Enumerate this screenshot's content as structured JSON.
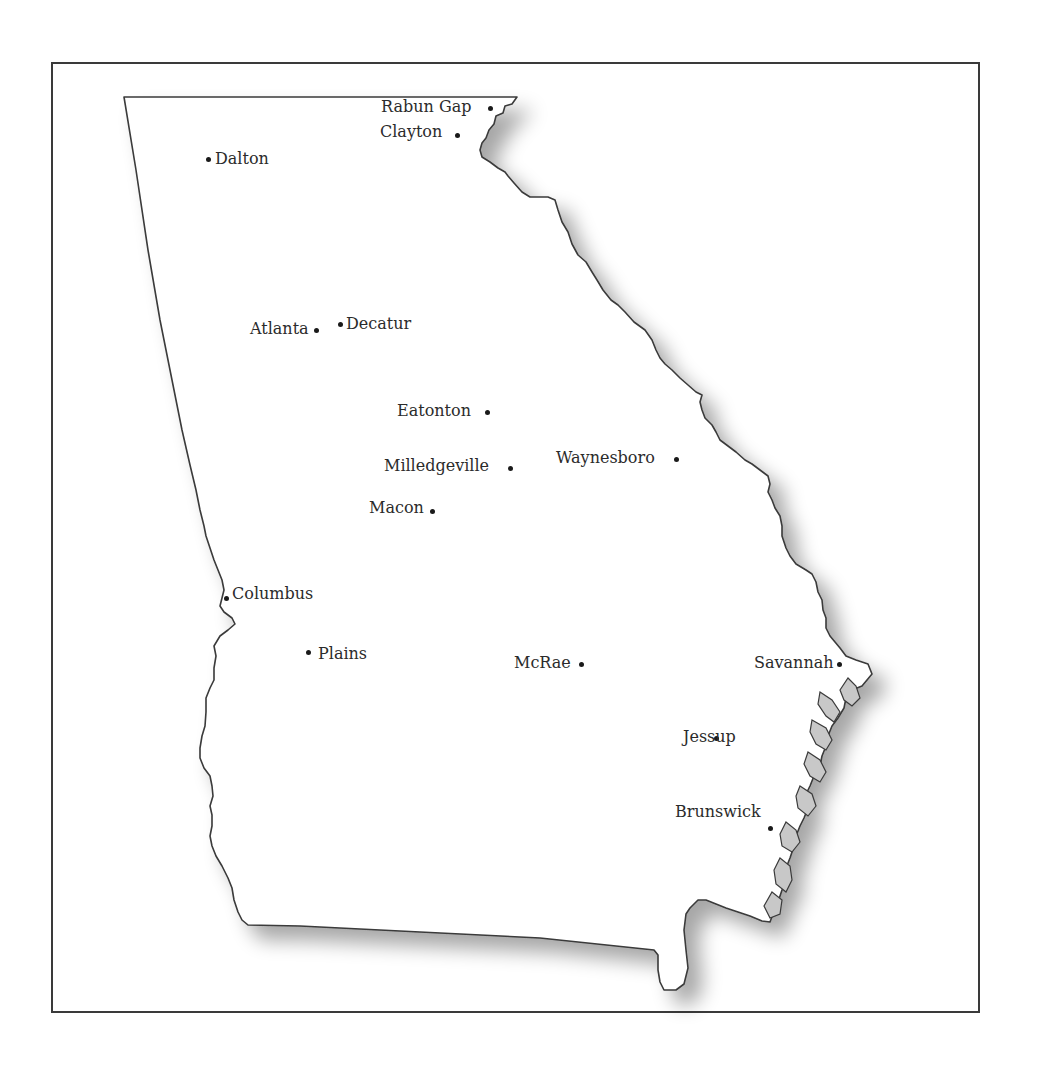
{
  "map": {
    "region": "Georgia",
    "colors": {
      "border": "#3a3a3a",
      "land": "#ffffff",
      "shadow": "#b5b5b5",
      "water": "#c8c8c8",
      "text": "#2b2b2b"
    },
    "cities": [
      {
        "name": "Rabun Gap",
        "dot": [
          490,
          108
        ],
        "label": [
          381,
          99
        ],
        "align": "left"
      },
      {
        "name": "Clayton",
        "dot": [
          457,
          135
        ],
        "label": [
          380,
          124
        ],
        "align": "left"
      },
      {
        "name": "Dalton",
        "dot": [
          208,
          159
        ],
        "label": [
          215,
          151
        ],
        "align": "right"
      },
      {
        "name": "Atlanta",
        "dot": [
          316,
          330
        ],
        "label": [
          250,
          321
        ],
        "align": "left"
      },
      {
        "name": "Decatur",
        "dot": [
          340,
          324
        ],
        "label": [
          346,
          316
        ],
        "align": "right"
      },
      {
        "name": "Eatonton",
        "dot": [
          487,
          412
        ],
        "label": [
          397,
          403
        ],
        "align": "left"
      },
      {
        "name": "Milledgeville",
        "dot": [
          510,
          468
        ],
        "label": [
          384,
          458
        ],
        "align": "left"
      },
      {
        "name": "Waynesboro",
        "dot": [
          676,
          459
        ],
        "label": [
          556,
          450
        ],
        "align": "left"
      },
      {
        "name": "Macon",
        "dot": [
          432,
          511
        ],
        "label": [
          369,
          500
        ],
        "align": "left"
      },
      {
        "name": "Columbus",
        "dot": [
          226,
          598
        ],
        "label": [
          232,
          586
        ],
        "align": "right"
      },
      {
        "name": "Plains",
        "dot": [
          308,
          652
        ],
        "label": [
          318,
          646
        ],
        "align": "right"
      },
      {
        "name": "McRae",
        "dot": [
          581,
          664
        ],
        "label": [
          514,
          655
        ],
        "align": "left"
      },
      {
        "name": "Savannah",
        "dot": [
          839,
          664
        ],
        "label": [
          754,
          655
        ],
        "align": "left"
      },
      {
        "name": "Jessup",
        "dot": [
          716,
          738
        ],
        "label": [
          683,
          729
        ],
        "align": "left"
      },
      {
        "name": "Brunswick",
        "dot": [
          770,
          828
        ],
        "label": [
          675,
          804
        ],
        "align": "left"
      }
    ]
  }
}
